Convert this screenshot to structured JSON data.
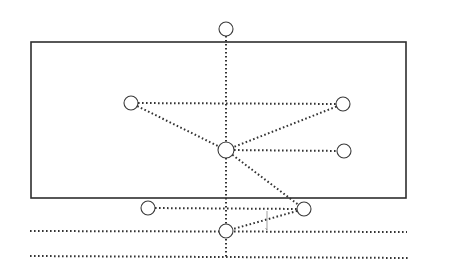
{
  "diagram": {
    "type": "node-link diagram with bounding frame",
    "colors": {
      "background": "#ffffff",
      "stroke": "#3a3a3a",
      "frame": "#2e2e2e",
      "dots": "#333333"
    },
    "frame": {
      "x1": 31,
      "y1": 42,
      "x2": 406,
      "y2": 198
    },
    "nodes": [
      {
        "id": "top",
        "x": 226,
        "y": 29,
        "r": 7
      },
      {
        "id": "upper-left",
        "x": 131,
        "y": 103,
        "r": 7
      },
      {
        "id": "upper-right",
        "x": 343,
        "y": 104,
        "r": 7
      },
      {
        "id": "center",
        "x": 226,
        "y": 150,
        "r": 8
      },
      {
        "id": "middle-right",
        "x": 344,
        "y": 151,
        "r": 7
      },
      {
        "id": "lower-left",
        "x": 148,
        "y": 208,
        "r": 7
      },
      {
        "id": "lower-right",
        "x": 304,
        "y": 209,
        "r": 7
      },
      {
        "id": "bottom",
        "x": 226,
        "y": 231,
        "r": 7
      }
    ],
    "edges": [
      {
        "from": "top",
        "to": "center"
      },
      {
        "from": "upper-left",
        "to": "upper-right"
      },
      {
        "from": "upper-left",
        "to": "center"
      },
      {
        "from": "upper-right",
        "to": "center"
      },
      {
        "from": "center",
        "to": "middle-right"
      },
      {
        "from": "center",
        "to": "lower-right"
      },
      {
        "from": "center",
        "to": "bottom"
      },
      {
        "from": "lower-left",
        "to": "lower-right"
      },
      {
        "from": "lower-right",
        "to": "bottom"
      }
    ],
    "extra_lines": [
      {
        "id": "vertical-tail",
        "x1": 226,
        "y1": 239,
        "x2": 226,
        "y2": 257
      },
      {
        "id": "baseline-upper",
        "x1": 30,
        "y1": 231,
        "x2": 407,
        "y2": 232
      },
      {
        "id": "baseline-lower",
        "x1": 30,
        "y1": 256,
        "x2": 408,
        "y2": 258
      }
    ],
    "marker": {
      "id": "angle-tick",
      "x": 267,
      "y1": 211,
      "y2": 230
    }
  }
}
